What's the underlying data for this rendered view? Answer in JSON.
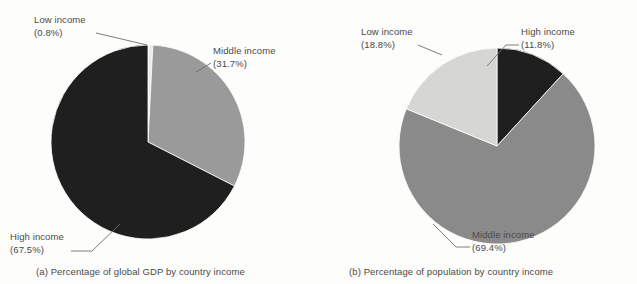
{
  "figure": {
    "background_color": "#fdfdfc",
    "text_color": "#4a4a4a",
    "leader_color": "#6e6e6e"
  },
  "panels": [
    {
      "id": "a",
      "caption": "(a) Percentage of global GDP by country income",
      "labels": {
        "low": {
          "name": "Low income",
          "value": "(0.8%)"
        },
        "middle": {
          "name": "Middle income",
          "value": "(31.7%)"
        },
        "high": {
          "name": "High income",
          "value": "(67.5%)"
        }
      }
    },
    {
      "id": "b",
      "caption": "(b) Percentage of population by country income",
      "labels": {
        "low": {
          "name": "Low income",
          "value": "(18.8%)"
        },
        "high": {
          "name": "High income",
          "value": "(11.8%)"
        },
        "middle": {
          "name": "Middle income",
          "value": "(69.4%)"
        }
      }
    }
  ],
  "chart_data": [
    {
      "type": "pie",
      "title": "(a) Percentage of global GDP by country income",
      "categories": [
        "Low income",
        "Middle income",
        "High income"
      ],
      "values": [
        0.8,
        31.7,
        67.5
      ],
      "value_labels": [
        "(0.8%)",
        "(31.7%)",
        "(67.5%)"
      ],
      "colors": [
        "#eceae6",
        "#9a9a9a",
        "#1f1f1f"
      ],
      "start_angle_deg": 0,
      "direction": "clockwise",
      "legend": "none",
      "labels_position": "outside-with-leader-lines",
      "units": "percent"
    },
    {
      "type": "pie",
      "title": "(b) Percentage of population by country income",
      "categories": [
        "High income",
        "Middle income",
        "Low income"
      ],
      "values": [
        11.8,
        69.4,
        18.8
      ],
      "value_labels": [
        "(11.8%)",
        "(69.4%)",
        "(18.8%)"
      ],
      "colors": [
        "#1f1f1f",
        "#8a8a8a",
        "#d6d6d4"
      ],
      "start_angle_deg": 0,
      "direction": "clockwise",
      "legend": "none",
      "labels_position": "outside-with-leader-lines",
      "units": "percent"
    }
  ]
}
